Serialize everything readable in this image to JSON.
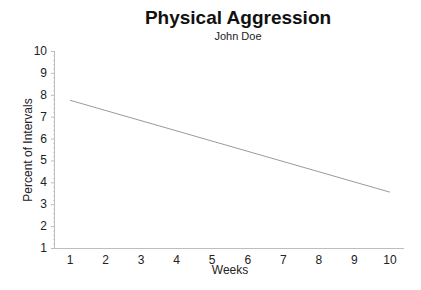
{
  "chart_data": {
    "type": "line",
    "title": "Physical Aggression",
    "subtitle": "John Doe",
    "xlabel": "Weeks",
    "ylabel": "Percent of Intervals",
    "x": [
      1,
      10
    ],
    "series": [
      {
        "name": "Trend",
        "values": [
          7.75,
          3.55
        ],
        "color": "#9a9a9a"
      }
    ],
    "x_ticks": [
      "1",
      "2",
      "3",
      "4",
      "5",
      "6",
      "7",
      "8",
      "9",
      "10"
    ],
    "y_ticks": [
      "1",
      "2",
      "3",
      "4",
      "5",
      "6",
      "7",
      "8",
      "9",
      "10"
    ],
    "xlim": [
      0.55,
      10.4
    ],
    "ylim": [
      1,
      10
    ],
    "grid": false,
    "legend": "none"
  },
  "colors": {
    "axis": "#bdbdbd",
    "line": "#9a9a9a",
    "text": "#222222"
  }
}
